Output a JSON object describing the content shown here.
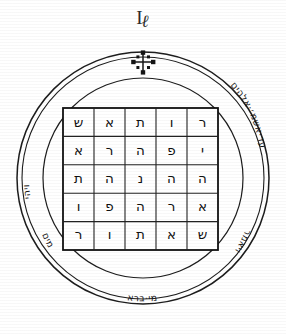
{
  "plate": {
    "figure_number": "I",
    "figure_number_tail": "ℓ",
    "title_alt": "Pentacle"
  },
  "seal": {
    "top_symbol": "cross-crosslet",
    "ring_segments": [
      {
        "position": "upper-right",
        "text": "עד·אשמ׳·אלהים"
      },
      {
        "position": "left",
        "text": "ויהי"
      },
      {
        "position": "lower-left",
        "text": "מים"
      },
      {
        "position": "bottom",
        "text": "מי·ברא"
      },
      {
        "position": "lower-right",
        "text": "ויאמר"
      }
    ]
  },
  "magic_square": {
    "rows": 5,
    "cols": 5,
    "cells": [
      [
        "ש",
        "א",
        "ת",
        "ו",
        "ר"
      ],
      [
        "א",
        "ר",
        "ה",
        "פ",
        "י"
      ],
      [
        "ת",
        "ה",
        "נ",
        "ה",
        "ה"
      ],
      [
        "ו",
        "פ",
        "ה",
        "ר",
        "א"
      ],
      [
        "ר",
        "ו",
        "ת",
        "א",
        "ש"
      ]
    ]
  },
  "colors": {
    "ink": "#1d1d1d",
    "paper": "#ffffff"
  }
}
